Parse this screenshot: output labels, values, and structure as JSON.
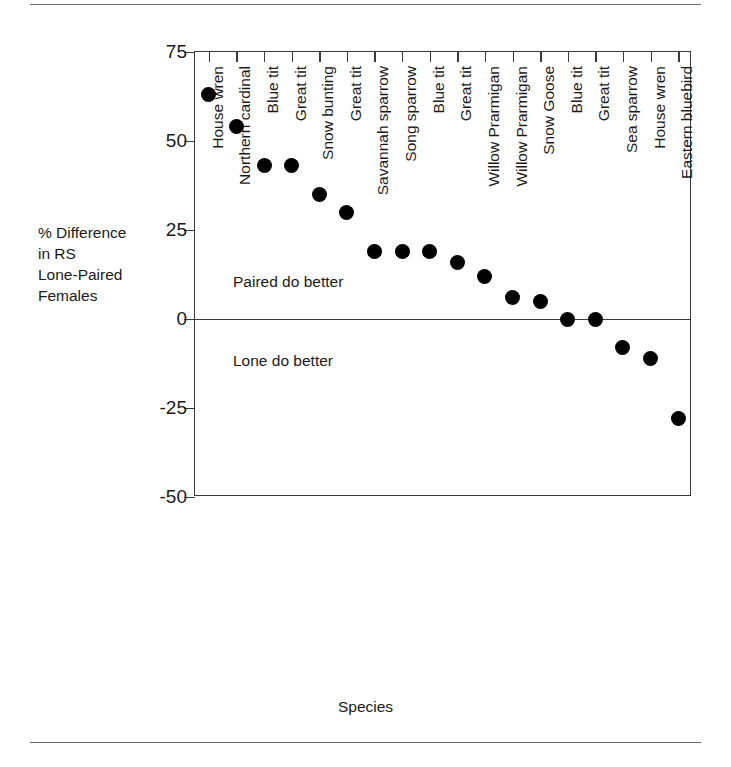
{
  "figure": {
    "y_axis_title": "% Difference\nin RS\nLone-Paired\nFemales",
    "x_axis_title": "Species"
  },
  "chart_data": {
    "type": "scatter",
    "title": "",
    "xlabel": "Species",
    "ylabel": "% Difference in RS Lone-Paired Females",
    "ylim": [
      -50,
      75
    ],
    "yticks": [
      75,
      50,
      25,
      0,
      -25,
      -50
    ],
    "ytick_labels": [
      "75",
      "50",
      "25",
      "0",
      "-25",
      "-50"
    ],
    "grid": false,
    "legend": "none",
    "marker": "filled-circle",
    "marker_color": "#000000",
    "reference_lines": [
      {
        "name": "zero-line",
        "y": 0
      }
    ],
    "annotations": [
      {
        "name": "paired-do-better-label",
        "text": "Paired do better",
        "y": 10
      },
      {
        "name": "lone-do-better-label",
        "text": "Lone do better",
        "y": -12
      }
    ],
    "categories": [
      "House wren",
      "Northern cardinal",
      "Blue tit",
      "Great tit",
      "Snow bunting",
      "Great tit",
      "Savannah sparrow",
      "Song sparrow",
      "Blue tit",
      "Great tit",
      "Willow Prarmigan",
      "Willow Prarmigan",
      "Snow Goose",
      "Blue tit",
      "Great tit",
      "Sea sparrow",
      "House wren",
      "Eastern bluebird"
    ],
    "values": [
      63,
      54,
      43,
      43,
      35,
      30,
      19,
      19,
      19,
      16,
      12,
      6,
      5,
      0,
      0,
      -8,
      -11,
      -28
    ]
  }
}
